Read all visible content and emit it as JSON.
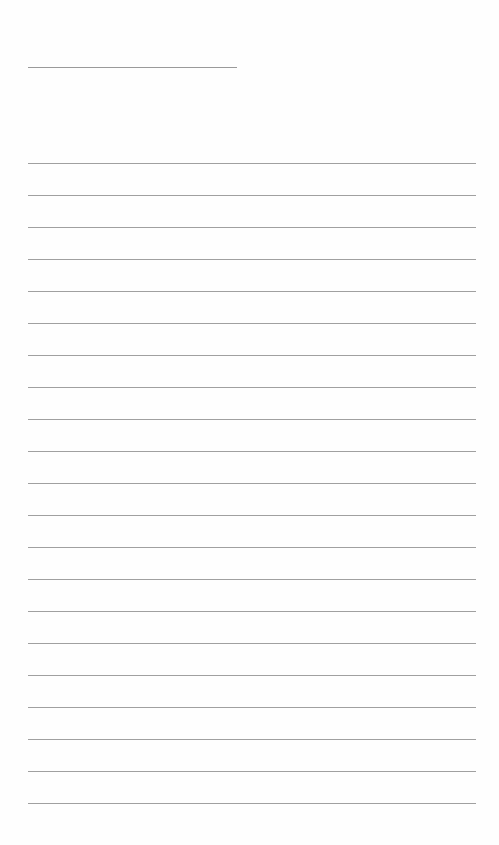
{
  "page": {
    "type": "lined-notepaper",
    "ruled_line_color": "#a0a0a0",
    "background_color": "#fefefe",
    "title_line": {
      "text": ""
    },
    "ruled_line_count": 21,
    "lines": [
      "",
      "",
      "",
      "",
      "",
      "",
      "",
      "",
      "",
      "",
      "",
      "",
      "",
      "",
      "",
      "",
      "",
      "",
      "",
      "",
      ""
    ]
  }
}
